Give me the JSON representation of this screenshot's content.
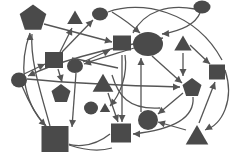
{
  "diagram": {
    "title": "",
    "type": "network-graph",
    "colors": {
      "background": "#ffffff",
      "node_fill": "#4a4a4a",
      "edge_stroke": "#555555"
    },
    "nodes": [
      {
        "id": "n1",
        "shape": "pentagon",
        "cx": 33,
        "cy": 17,
        "r": 14
      },
      {
        "id": "n2",
        "shape": "triangle",
        "cx": 75,
        "cy": 18,
        "r": 9
      },
      {
        "id": "n3",
        "shape": "circle",
        "cx": 100,
        "cy": 14,
        "rx": 8,
        "ry": 6.5
      },
      {
        "id": "n4",
        "shape": "circle",
        "cx": 202,
        "cy": 7,
        "rx": 8.5,
        "ry": 6.5
      },
      {
        "id": "n5",
        "shape": "square",
        "cx": 122,
        "cy": 43,
        "w": 18,
        "h": 15
      },
      {
        "id": "n6",
        "shape": "circle",
        "cx": 148,
        "cy": 44,
        "rx": 15,
        "ry": 12
      },
      {
        "id": "n7",
        "shape": "triangle",
        "cx": 183,
        "cy": 44,
        "r": 10
      },
      {
        "id": "n8",
        "shape": "square",
        "cx": 54,
        "cy": 60,
        "w": 18,
        "h": 16
      },
      {
        "id": "n9",
        "shape": "circle",
        "cx": 75,
        "cy": 66,
        "rx": 8,
        "ry": 7
      },
      {
        "id": "n10",
        "shape": "square",
        "cx": 217,
        "cy": 72,
        "w": 16,
        "h": 15
      },
      {
        "id": "n11",
        "shape": "circle",
        "cx": 19,
        "cy": 80,
        "rx": 8,
        "ry": 7.5
      },
      {
        "id": "n12",
        "shape": "pentagon",
        "cx": 61,
        "cy": 93,
        "r": 10
      },
      {
        "id": "n13",
        "shape": "triangle",
        "cx": 103,
        "cy": 84,
        "r": 12
      },
      {
        "id": "n14",
        "shape": "pentagon",
        "cx": 192,
        "cy": 87,
        "r": 10
      },
      {
        "id": "n15",
        "shape": "circle",
        "cx": 91,
        "cy": 108,
        "rx": 7,
        "ry": 6.5
      },
      {
        "id": "n16",
        "shape": "triangle",
        "cx": 105,
        "cy": 108,
        "r": 6
      },
      {
        "id": "n17",
        "shape": "circle",
        "cx": 148,
        "cy": 120,
        "rx": 10,
        "ry": 10
      },
      {
        "id": "n18",
        "shape": "square",
        "cx": 55,
        "cy": 139,
        "w": 27,
        "h": 26
      },
      {
        "id": "n19",
        "shape": "square",
        "cx": 121,
        "cy": 133,
        "w": 20,
        "h": 19
      },
      {
        "id": "n20",
        "shape": "triangle",
        "cx": 197,
        "cy": 136,
        "r": 13
      }
    ],
    "edges": [
      {
        "from": "n1",
        "to": "n8",
        "d": "M44 24 L112 42"
      },
      {
        "from": "n8",
        "to": "n2",
        "d": "M60 52 L72 28"
      },
      {
        "from": "n8",
        "to": "n3",
        "d": "M62 52 L93 20"
      },
      {
        "from": "n3",
        "to": "n6",
        "d": "M108 12 C140 0 195 10 222 60"
      },
      {
        "from": "n3",
        "to": "n6b",
        "d": "M112 12 C125 20 135 28 140 33"
      },
      {
        "from": "n4",
        "to": "n6",
        "d": "M195 9 C170 4 145 10 133 33"
      },
      {
        "from": "n4",
        "to": "n6c",
        "d": "M200 13 C195 25 180 31 162 34"
      },
      {
        "from": "n18",
        "to": "n1",
        "d": "M46 126 C20 100 20 60 30 33"
      },
      {
        "from": "n18",
        "to": "n1b",
        "d": "M50 126 C40 90 30 60 32 34"
      },
      {
        "from": "n11",
        "to": "n8",
        "d": "M24 74 L45 64"
      },
      {
        "from": "n11",
        "to": "n18",
        "d": "M22 86 C30 105 38 118 46 126"
      },
      {
        "from": "n11",
        "to": "n14",
        "d": "M27 79 C80 84 140 86 180 87"
      },
      {
        "from": "n9",
        "to": "n5",
        "d": "M83 62 L110 50"
      },
      {
        "from": "n6",
        "to": "n9",
        "d": "M134 48 C115 54 95 60 84 64"
      },
      {
        "from": "n8",
        "to": "n12",
        "d": "M58 69 L62 82"
      },
      {
        "from": "n9",
        "to": "n19",
        "d": "M76 73 L72 127"
      },
      {
        "from": "n6",
        "to": "n11",
        "d": "M163 38 C110 48 60 60 28 76"
      },
      {
        "from": "n13",
        "to": "n19",
        "d": "M108 93 L118 122"
      },
      {
        "from": "n6",
        "to": "n19",
        "d": "M122 55 L122 122"
      },
      {
        "from": "n7",
        "to": "n14",
        "d": "M183 53 L183 76"
      },
      {
        "from": "n6",
        "to": "n14b",
        "d": "M152 56 L182 83"
      },
      {
        "from": "n7",
        "to": "n10",
        "d": "M190 45 L210 64"
      },
      {
        "from": "n17",
        "to": "n6",
        "d": "M141 112 L141 58"
      },
      {
        "from": "n14",
        "to": "n17",
        "d": "M183 93 L158 114"
      },
      {
        "from": "n14",
        "to": "n19",
        "d": "M193 97 C195 120 170 130 133 134"
      },
      {
        "from": "n20",
        "to": "n10",
        "d": "M199 123 L215 82"
      },
      {
        "from": "n20",
        "to": "n17",
        "d": "M186 130 L158 122"
      },
      {
        "from": "n10",
        "to": "n20",
        "d": "M225 70 C235 100 222 125 205 130"
      },
      {
        "from": "n13",
        "to": "n18",
        "d": "M110 134 C90 150 70 145 69 144"
      },
      {
        "from": "n18",
        "to": "n19",
        "d": "M69 145 C90 152 105 150 112 148"
      },
      {
        "from": "n5",
        "to": "n16",
        "d": "M125 55 C128 75 120 95 110 106"
      },
      {
        "from": "n13",
        "to": "n19b",
        "d": "M112 75 C118 95 128 110 160 108"
      },
      {
        "from": "n8",
        "to": "n13",
        "d": "M72 58 L118 68"
      }
    ],
    "edge_arrows": [
      {
        "x": 112,
        "y": 42,
        "angle": 15
      },
      {
        "x": 72,
        "y": 28,
        "angle": -65
      },
      {
        "x": 93,
        "y": 20,
        "angle": -45
      },
      {
        "x": 140,
        "y": 33,
        "angle": 40
      },
      {
        "x": 162,
        "y": 34,
        "angle": 175
      },
      {
        "x": 30,
        "y": 33,
        "angle": -90
      },
      {
        "x": 45,
        "y": 64,
        "angle": -25
      },
      {
        "x": 46,
        "y": 126,
        "angle": 45
      },
      {
        "x": 180,
        "y": 87,
        "angle": 0
      },
      {
        "x": 110,
        "y": 50,
        "angle": -25
      },
      {
        "x": 84,
        "y": 64,
        "angle": 165
      },
      {
        "x": 62,
        "y": 82,
        "angle": 75
      },
      {
        "x": 72,
        "y": 127,
        "angle": 95
      },
      {
        "x": 118,
        "y": 122,
        "angle": 70
      },
      {
        "x": 122,
        "y": 122,
        "angle": 90
      },
      {
        "x": 183,
        "y": 76,
        "angle": 90
      },
      {
        "x": 182,
        "y": 83,
        "angle": 40
      },
      {
        "x": 210,
        "y": 64,
        "angle": 40
      },
      {
        "x": 141,
        "y": 58,
        "angle": -90
      },
      {
        "x": 158,
        "y": 114,
        "angle": 140
      },
      {
        "x": 133,
        "y": 134,
        "angle": 180
      },
      {
        "x": 215,
        "y": 82,
        "angle": -70
      },
      {
        "x": 158,
        "y": 122,
        "angle": 195
      },
      {
        "x": 205,
        "y": 130,
        "angle": 150
      },
      {
        "x": 28,
        "y": 76,
        "angle": 155
      },
      {
        "x": 110,
        "y": 106,
        "angle": 130
      }
    ]
  }
}
